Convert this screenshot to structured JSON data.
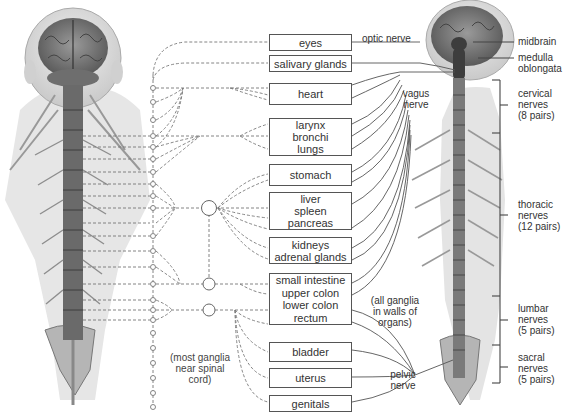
{
  "left_figure": {
    "description": "sympathetic division - posterior view of head and spinal cord with chain ganglia",
    "chain_ganglia_note": [
      "(most ganglia",
      "near spinal",
      "cord)"
    ]
  },
  "organs": [
    {
      "id": "eyes",
      "lines": [
        "eyes"
      ]
    },
    {
      "id": "salivary",
      "lines": [
        "salivary glands"
      ]
    },
    {
      "id": "heart",
      "lines": [
        "heart"
      ]
    },
    {
      "id": "respiratory",
      "lines": [
        "larynx",
        "bronchi",
        "lungs"
      ]
    },
    {
      "id": "stomach",
      "lines": [
        "stomach"
      ]
    },
    {
      "id": "digestive-glands",
      "lines": [
        "liver",
        "spleen",
        "pancreas"
      ]
    },
    {
      "id": "kidneys",
      "lines": [
        "kidneys",
        "adrenal glands"
      ]
    },
    {
      "id": "intestine",
      "lines": [
        "small intestine",
        "upper colon",
        "lower colon",
        "rectum"
      ]
    },
    {
      "id": "bladder",
      "lines": [
        "bladder"
      ]
    },
    {
      "id": "uterus",
      "lines": [
        "uterus"
      ]
    },
    {
      "id": "genitals",
      "lines": [
        "genitals"
      ]
    }
  ],
  "right_figure": {
    "description": "parasympathetic division - posterior view of brain and spinal cord",
    "nerve_labels": {
      "optic": "optic nerve",
      "vagus": [
        "vagus",
        "nerve"
      ],
      "pelvic": [
        "pelvic",
        "nerve"
      ],
      "ganglia_note": [
        "(all ganglia",
        "in walls of",
        "organs)"
      ]
    },
    "brain_labels": {
      "midbrain": "midbrain",
      "medulla": [
        "medulla",
        "oblongata"
      ]
    },
    "spinal_regions": [
      {
        "id": "cervical",
        "lines": [
          "cervical",
          "nerves",
          "(8 pairs)"
        ]
      },
      {
        "id": "thoracic",
        "lines": [
          "thoracic",
          "nerves",
          "(12 pairs)"
        ]
      },
      {
        "id": "lumbar",
        "lines": [
          "lumbar",
          "nerves",
          "(5 pairs)"
        ]
      },
      {
        "id": "sacral",
        "lines": [
          "sacral",
          "nerves",
          "(5 pairs)"
        ]
      }
    ]
  },
  "colors": {
    "line": "#555555",
    "dashed": "#888888",
    "text": "#333333",
    "anatomy_dark": "#3a3a3a",
    "anatomy_mid": "#8a8a8a",
    "skin": "#d9d9d9"
  }
}
